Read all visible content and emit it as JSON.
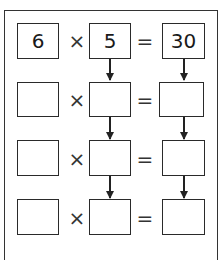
{
  "diagram": {
    "operators": {
      "multiply": "×",
      "equals": "="
    },
    "rows": [
      {
        "a": "6",
        "b": "5",
        "c": "30"
      },
      {
        "a": "",
        "b": "",
        "c": ""
      },
      {
        "a": "",
        "b": "",
        "c": ""
      },
      {
        "a": "",
        "b": "",
        "c": ""
      }
    ],
    "arrows": "down arrows connect column 2 and column 3 boxes from each row to the next"
  }
}
